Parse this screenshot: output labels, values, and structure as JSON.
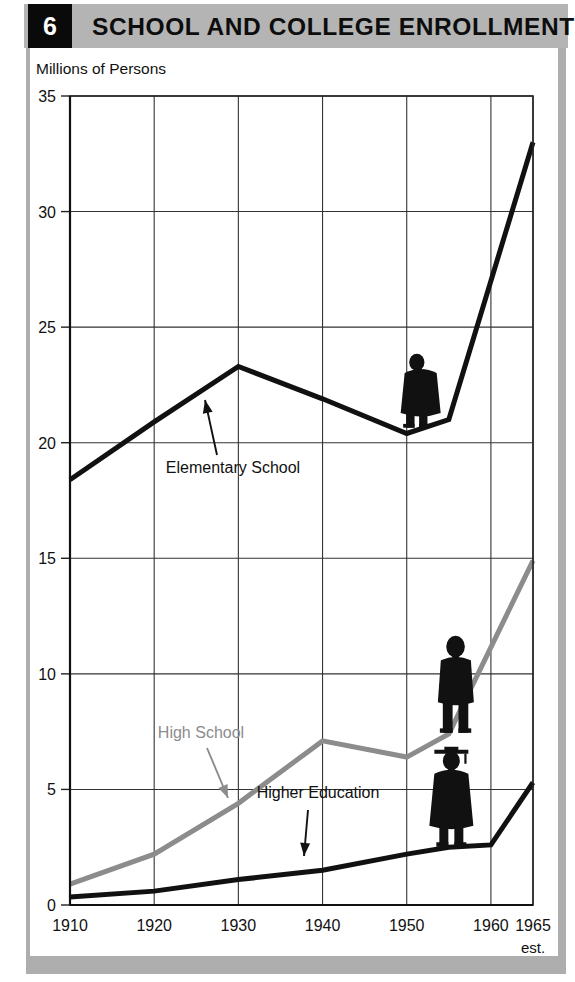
{
  "header": {
    "number": "6",
    "title": "SCHOOL AND COLLEGE ENROLLMENT",
    "band_color": "#b4b4b4",
    "number_box_color": "#0a0a0a"
  },
  "chart_data": {
    "type": "line",
    "title": "SCHOOL AND COLLEGE ENROLLMENT",
    "xlabel": "",
    "ylabel": "Millions of Persons",
    "ylim": [
      0,
      35
    ],
    "xlim": [
      1910,
      1965
    ],
    "yticks": [
      "0",
      "5",
      "10",
      "15",
      "20",
      "25",
      "30",
      "35"
    ],
    "ytick_values": [
      0,
      5,
      10,
      15,
      20,
      25,
      30,
      35
    ],
    "xticks": [
      "1910",
      "1920",
      "1930",
      "1940",
      "1950",
      "1960",
      "1965"
    ],
    "xtick_values": [
      1910,
      1920,
      1930,
      1940,
      1950,
      1960,
      1965
    ],
    "xtick_note": "est.",
    "grid": true,
    "legend": "inline-annotations",
    "series": [
      {
        "name": "Elementary School",
        "color": "#111111",
        "width": 5,
        "x": [
          1910,
          1920,
          1930,
          1940,
          1950,
          1955,
          1965
        ],
        "values": [
          18.4,
          20.9,
          23.3,
          21.9,
          20.4,
          21.0,
          33.0
        ]
      },
      {
        "name": "High School",
        "color": "#8c8c8c",
        "width": 5,
        "x": [
          1910,
          1920,
          1930,
          1940,
          1950,
          1955,
          1965
        ],
        "values": [
          0.9,
          2.2,
          4.4,
          7.1,
          6.4,
          7.4,
          14.9
        ]
      },
      {
        "name": "Higher Education",
        "color": "#111111",
        "width": 5,
        "x": [
          1910,
          1920,
          1930,
          1940,
          1950,
          1955,
          1960,
          1965
        ],
        "values": [
          0.35,
          0.6,
          1.1,
          1.5,
          2.2,
          2.5,
          2.6,
          5.3
        ]
      }
    ],
    "annotations": [
      {
        "text": "Elementary School",
        "color": "#111111"
      },
      {
        "text": "High School",
        "color": "#8c8c8c"
      },
      {
        "text": "Higher Education",
        "color": "#111111"
      }
    ],
    "figures": [
      {
        "name": "child-silhouette",
        "series": "Elementary School"
      },
      {
        "name": "teen-silhouette",
        "series": "High School"
      },
      {
        "name": "graduate-silhouette",
        "series": "Higher Education"
      }
    ]
  }
}
